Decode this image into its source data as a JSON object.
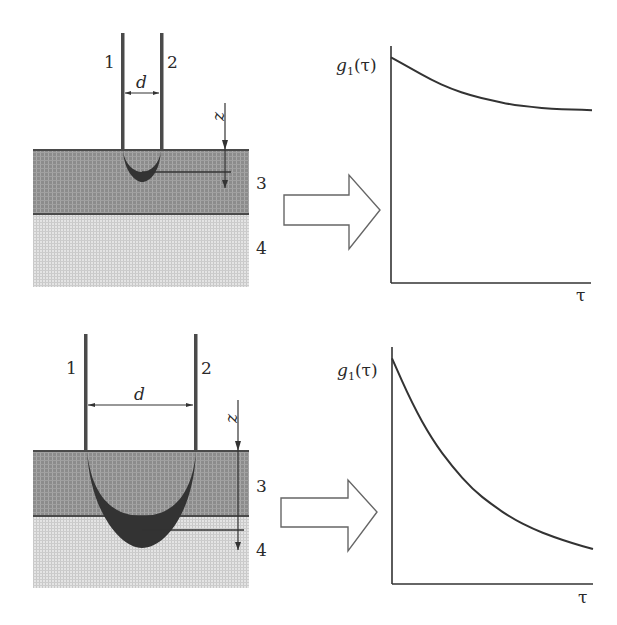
{
  "figure": {
    "panels": [
      {
        "id": "short-separation",
        "fiber_labels": [
          "1",
          "2"
        ],
        "separation_label": "d",
        "depth_axis_label": "z",
        "layer_labels": [
          "3",
          "4"
        ],
        "probe_depth_reaches": "layer 3 only",
        "plot": {
          "y_label_main": "g",
          "y_label_sub": "1",
          "y_label_arg": "(τ)",
          "x_label": "τ",
          "curve": "slow decay"
        }
      },
      {
        "id": "long-separation",
        "fiber_labels": [
          "1",
          "2"
        ],
        "separation_label": "d",
        "depth_axis_label": "z",
        "layer_labels": [
          "3",
          "4"
        ],
        "probe_depth_reaches": "layer 4",
        "plot": {
          "y_label_main": "g",
          "y_label_sub": "1",
          "y_label_arg": "(τ)",
          "x_label": "τ",
          "curve": "fast decay"
        }
      }
    ],
    "colors": {
      "ink": "#2a2a2a",
      "layer3": "#8a8a8a",
      "layer4": "#d6d6d6",
      "banana": "#3a3a3a"
    }
  },
  "chart_data": [
    {
      "type": "line",
      "title": "",
      "xlabel": "τ",
      "ylabel": "g1(τ)",
      "x": [
        0,
        0.1,
        0.2,
        0.3,
        0.4,
        0.5,
        0.6,
        0.7,
        0.8,
        0.9,
        1.0
      ],
      "series": [
        {
          "name": "g1",
          "values": [
            1.0,
            0.95,
            0.9,
            0.86,
            0.83,
            0.81,
            0.79,
            0.78,
            0.77,
            0.77,
            0.765
          ]
        }
      ],
      "xlim": [
        0,
        1.05
      ],
      "ylim": [
        0,
        1.05
      ],
      "grid": false
    },
    {
      "type": "line",
      "title": "",
      "xlabel": "τ",
      "ylabel": "g1(τ)",
      "x": [
        0,
        0.1,
        0.2,
        0.3,
        0.4,
        0.5,
        0.6,
        0.7,
        0.8,
        0.9,
        1.0
      ],
      "series": [
        {
          "name": "g1",
          "values": [
            1.0,
            0.8,
            0.64,
            0.52,
            0.42,
            0.35,
            0.29,
            0.245,
            0.21,
            0.18,
            0.155
          ]
        }
      ],
      "xlim": [
        0,
        1.05
      ],
      "ylim": [
        0,
        1.05
      ],
      "grid": false
    }
  ]
}
